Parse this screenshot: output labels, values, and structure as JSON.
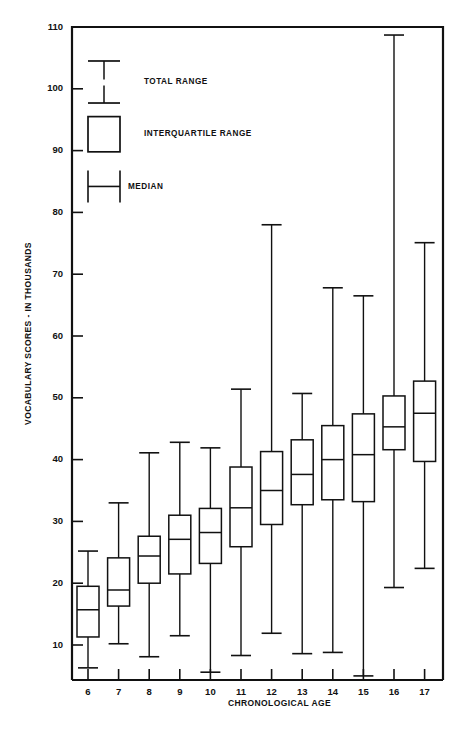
{
  "chart_data": {
    "type": "box",
    "title": "",
    "xlabel": "CHRONOLOGICAL AGE",
    "ylabel": "VOCABULARY SCORES - IN THOUSANDS",
    "xlim": [
      5.4,
      17.8
    ],
    "ylim": [
      0,
      110
    ],
    "yticks": [
      10,
      20,
      30,
      40,
      50,
      60,
      70,
      80,
      90,
      100,
      110
    ],
    "ytick_labels": [
      "10",
      "20",
      "30",
      "40",
      "50",
      "60",
      "70",
      "80",
      "90",
      "100",
      "110"
    ],
    "xticks": [
      6,
      7,
      8,
      9,
      10,
      11,
      12,
      13,
      14,
      15,
      16,
      17
    ],
    "xtick_labels": [
      "6",
      "7",
      "8",
      "9",
      "10",
      "11",
      "12",
      "13",
      "14",
      "15",
      "16",
      "17"
    ],
    "grid": false,
    "categories": [
      "6",
      "7",
      "8",
      "9",
      "10",
      "11",
      "12",
      "13",
      "14",
      "15",
      "16",
      "17"
    ],
    "boxes": [
      {
        "category": "6",
        "min": 6.3,
        "q1": 11.3,
        "median": 15.7,
        "q3": 19.5,
        "max": 25.2
      },
      {
        "category": "7",
        "min": 10.2,
        "q1": 16.3,
        "median": 18.9,
        "q3": 24.1,
        "max": 33.0
      },
      {
        "category": "8",
        "min": 8.1,
        "q1": 20.0,
        "median": 24.4,
        "q3": 27.6,
        "max": 41.1
      },
      {
        "category": "9",
        "min": 11.5,
        "q1": 21.5,
        "median": 27.1,
        "q3": 31.0,
        "max": 42.8
      },
      {
        "category": "10",
        "min": 5.6,
        "q1": 23.2,
        "median": 28.2,
        "q3": 32.1,
        "max": 41.9
      },
      {
        "category": "11",
        "min": 8.3,
        "q1": 25.9,
        "median": 32.2,
        "q3": 38.8,
        "max": 51.4
      },
      {
        "category": "12",
        "min": 11.9,
        "q1": 29.5,
        "median": 35.0,
        "q3": 41.3,
        "max": 78.0
      },
      {
        "category": "13",
        "min": 8.6,
        "q1": 32.7,
        "median": 37.6,
        "q3": 43.2,
        "max": 50.7
      },
      {
        "category": "14",
        "min": 8.8,
        "q1": 33.5,
        "median": 40.0,
        "q3": 45.5,
        "max": 67.8
      },
      {
        "category": "15",
        "min": 5.0,
        "q1": 33.2,
        "median": 40.8,
        "q3": 47.4,
        "max": 66.5
      },
      {
        "category": "16",
        "min": 19.3,
        "q1": 41.6,
        "median": 45.3,
        "q3": 50.3,
        "max": 108.7
      },
      {
        "category": "17",
        "min": 22.4,
        "q1": 39.7,
        "median": 47.5,
        "q3": 52.7,
        "max": 75.1
      }
    ],
    "legend": {
      "position": "upper-left-inside",
      "entries": [
        {
          "key": "total-range",
          "label": "TOTAL RANGE"
        },
        {
          "key": "interquartile-range",
          "label": "INTERQUARTILE RANGE"
        },
        {
          "key": "median",
          "label": "MEDIAN"
        }
      ]
    }
  }
}
